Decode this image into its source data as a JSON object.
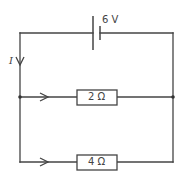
{
  "diagram": {
    "type": "circuit",
    "colors": {
      "wire": "#444444",
      "resistor_fill": "#ffffff",
      "text": "#444444"
    },
    "battery": {
      "label": "6 V",
      "voltage": 6,
      "unit": "V"
    },
    "current": {
      "label": "I",
      "direction": "down"
    },
    "resistors": [
      {
        "id": "R1",
        "label": "2 Ω",
        "value": 2,
        "unit": "Ω",
        "branch": "upper"
      },
      {
        "id": "R2",
        "label": "4 Ω",
        "value": 4,
        "unit": "Ω",
        "branch": "lower"
      }
    ],
    "branch_arrows": [
      {
        "branch": "upper",
        "direction": "right"
      },
      {
        "branch": "lower",
        "direction": "right"
      }
    ],
    "junctions": [
      {
        "id": "left",
        "position": "left node"
      },
      {
        "id": "right",
        "position": "right node"
      }
    ]
  }
}
